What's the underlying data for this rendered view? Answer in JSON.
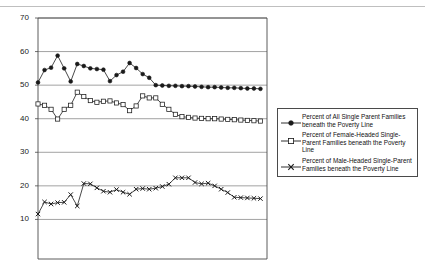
{
  "page": {
    "cut_off_header_text": "",
    "background_color": "#ffffff"
  },
  "chart_data": {
    "type": "line",
    "title": "",
    "subtitle": "",
    "xlabel": "",
    "ylabel": "",
    "ylim": [
      0,
      70
    ],
    "yticks": [
      10,
      20,
      30,
      40,
      50,
      60,
      70
    ],
    "ytick_labels": [
      "10",
      "20",
      "30",
      "40",
      "50",
      "60",
      "70"
    ],
    "grid": true,
    "grid_axis": "y",
    "legend_position": "right",
    "x": [
      1,
      2,
      3,
      4,
      5,
      6,
      7,
      8,
      9,
      10,
      11,
      12,
      13,
      14,
      15,
      16,
      17,
      18,
      19,
      20,
      21,
      22,
      23,
      24,
      25,
      26,
      27,
      28,
      29,
      30,
      31,
      32,
      33,
      34,
      35
    ],
    "colors": {
      "series_line": "#1a1a1a",
      "axis": "#4a4a4a",
      "grid": "#8a8a8a",
      "marker_fill_all": "#1a1a1a",
      "marker_fill_female": "#ffffff"
    },
    "series": [
      {
        "name": "Percent of All Single Parent Families beneath the Poverty Line",
        "marker": "filled-diamond",
        "values": [
          50.8,
          54.5,
          55.2,
          58.8,
          55.0,
          51.1,
          56.3,
          55.7,
          55.0,
          54.8,
          54.6,
          51.2,
          53.0,
          54.0,
          56.6,
          55.1,
          53.3,
          52.2,
          50.0,
          49.9,
          49.8,
          49.8,
          49.7,
          49.7,
          49.6,
          49.5,
          49.4,
          49.4,
          49.3,
          49.2,
          49.2,
          49.1,
          49.0,
          49.0,
          48.9
        ]
      },
      {
        "name": "Percent of Female-Headed Single-Parent Families beneath the Poverty Line",
        "marker": "open-square",
        "values": [
          44.4,
          44.0,
          42.8,
          39.9,
          42.8,
          44.0,
          47.9,
          46.6,
          45.4,
          44.9,
          45.2,
          45.3,
          44.7,
          44.2,
          42.4,
          43.8,
          46.8,
          46.2,
          46.2,
          44.3,
          42.8,
          41.3,
          40.6,
          40.4,
          40.2,
          40.1,
          40.0,
          40.0,
          39.9,
          39.8,
          39.7,
          39.6,
          39.5,
          39.4,
          39.3
        ]
      },
      {
        "name": "Percent of Male-Headed Single-Parent Families beneath the Poverty Line",
        "marker": "x",
        "values": [
          11.6,
          15.2,
          14.6,
          15.0,
          15.1,
          17.4,
          14.0,
          20.7,
          20.6,
          19.4,
          18.4,
          18.1,
          18.9,
          18.1,
          17.5,
          19.0,
          19.2,
          19.0,
          19.3,
          19.8,
          20.5,
          22.4,
          22.4,
          22.4,
          21.0,
          20.6,
          20.8,
          20.0,
          19.0,
          18.0,
          16.6,
          16.5,
          16.4,
          16.3,
          16.2
        ]
      }
    ]
  },
  "legend": {
    "entries": [
      {
        "label": "Percent of All Single Parent Families beneath the Poverty Line",
        "marker": "filled-diamond"
      },
      {
        "label": "Percent of Female-Headed Single-Parent Families beneath the Poverty Line",
        "marker": "open-square"
      },
      {
        "label": "Percent of Male-Headed Single-Parent Families beneath the Poverty Line",
        "marker": "x"
      }
    ]
  }
}
